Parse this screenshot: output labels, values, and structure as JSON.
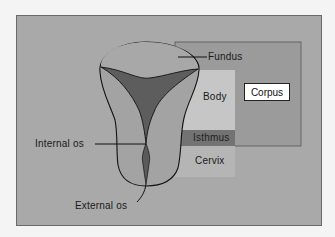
{
  "diagram": {
    "labels": {
      "fundus": "Fundus",
      "body": "Body",
      "corpus": "Corpus",
      "isthmus": "Isthmus",
      "cervix": "Cervix",
      "internal_os": "Internal os",
      "external_os": "External os"
    },
    "colors": {
      "background": "#a9a9a9",
      "corpus_region": "#9a9a9a",
      "body_region": "#c4c4c4",
      "isthmus_region": "#777777",
      "cervix_region": "#b4b4b4",
      "uterus_fill": "#a0a0a0",
      "cavity": "#5e5e5e"
    }
  }
}
